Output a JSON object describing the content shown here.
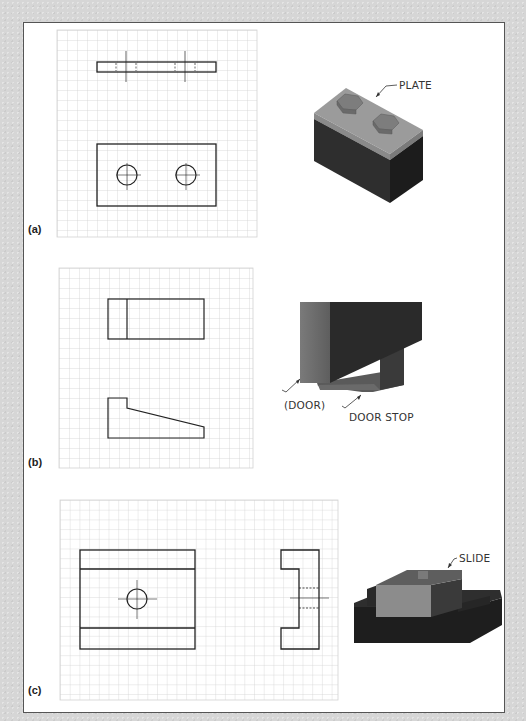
{
  "figure": {
    "panels": [
      {
        "id": "a",
        "label": "(a)",
        "callout": "PLATE",
        "grid": {
          "x": 57,
          "y": 30,
          "width": 200,
          "height": 207,
          "pitch": 10
        },
        "views": [
          "top view with two hidden-line holes",
          "front view rectangle with two circular holes"
        ]
      },
      {
        "id": "b",
        "label": "(b)",
        "callouts": [
          "(DOOR)",
          "DOOR STOP"
        ],
        "grid": {
          "x": 59,
          "y": 268,
          "width": 194,
          "height": 200,
          "pitch": 10
        },
        "views": [
          "rectangle with vertical division",
          "tapered profile"
        ]
      },
      {
        "id": "c",
        "label": "(c)",
        "callout": "SLIDE",
        "grid": {
          "x": 60,
          "y": 500,
          "width": 278,
          "height": 200,
          "pitch": 9.7
        },
        "views": [
          "front view with one circular hole",
          "side C-profile with hidden lines"
        ]
      }
    ],
    "colors": {
      "background": "#d6d6d6",
      "panel": "#ffffff",
      "grid_line": "#cfcfcf",
      "drawing_line": "#222222",
      "plate_top": "#9a9a9a",
      "block_dark": "#2a2a2a",
      "door_face": "#6b6b6b",
      "slide_top": "#8a8a8a"
    }
  }
}
